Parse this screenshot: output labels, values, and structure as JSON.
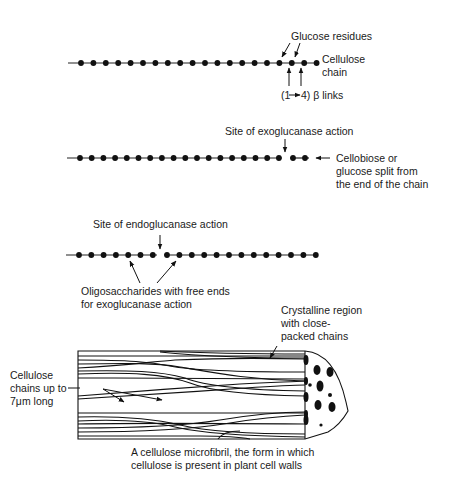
{
  "figure": {
    "background": "#ffffff",
    "ink_color": "#111111"
  },
  "panel_1": {
    "name": "Cellulose chain",
    "labels": {
      "glucose_residues": "Glucose residues",
      "cellulose_chain_line1": "Cellulose",
      "cellulose_chain_line2": "chain",
      "links_prefix": "(1",
      "links_suffix": "4) β links"
    },
    "residue_count": 20
  },
  "panel_2": {
    "name": "Exoglucanase action",
    "labels": {
      "site": "Site of exoglucanase action",
      "product_line1": "Cellobiose or",
      "product_line2": "glucose split from",
      "product_line3": "the end of the chain"
    },
    "residue_count_main": 18,
    "residue_count_split": 2
  },
  "panel_3": {
    "name": "Endoglucanase action",
    "labels": {
      "site": "Site of endoglucanase action",
      "oligo_line1": "Oligosaccharides with free ends",
      "oligo_line2": "for exoglucanase action"
    },
    "residue_count_left": 7,
    "residue_count_right": 13
  },
  "panel_4": {
    "name": "Cellulose microfibril",
    "labels": {
      "crystalline_line1": "Crystalline region",
      "crystalline_line2": "with close-",
      "crystalline_line3": "packed chains",
      "chains_line1": "Cellulose",
      "chains_line2": "chains up to",
      "chains_line3": "7μm long",
      "caption_line1": "A cellulose microfibril, the form in which",
      "caption_line2": "cellulose is present in plant cell walls"
    }
  }
}
